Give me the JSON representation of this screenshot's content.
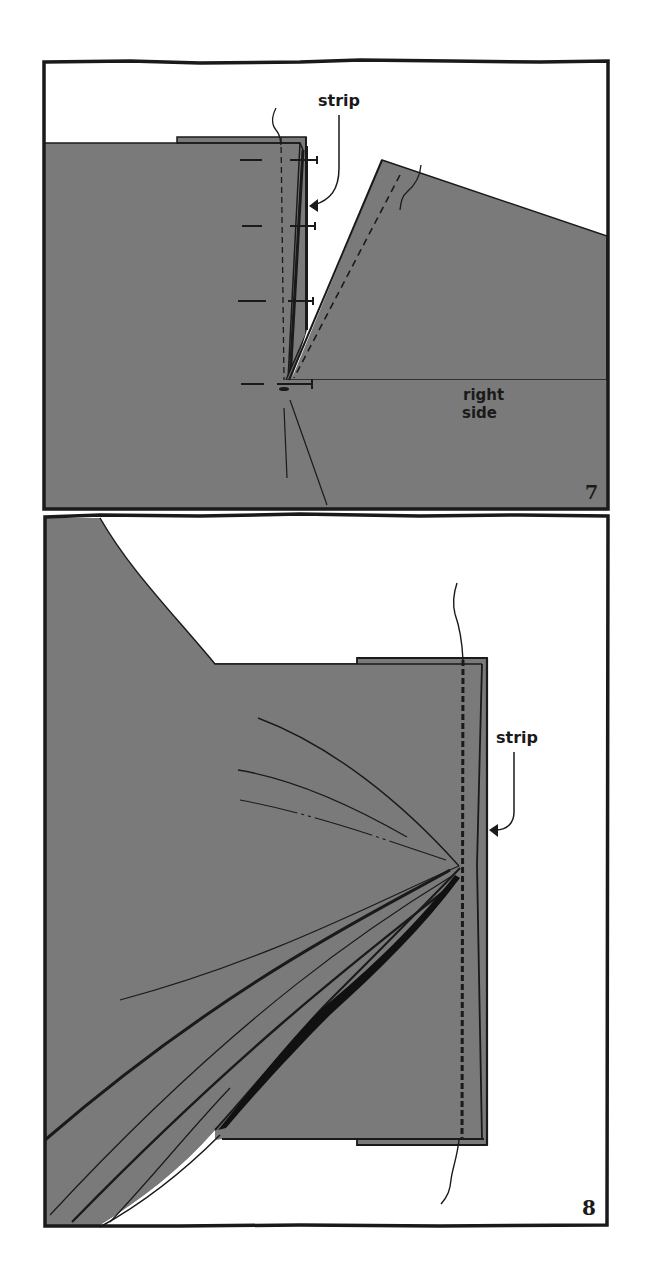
{
  "figure": {
    "panels": [
      {
        "number": "7",
        "labels": {
          "strip": "strip",
          "right_side_line1": "right",
          "right_side_line2": "side"
        }
      },
      {
        "number": "8",
        "labels": {
          "strip": "strip"
        }
      }
    ]
  },
  "colors": {
    "fabric": "#7a7a7a",
    "ink": "#1a1a1a",
    "paper": "#ffffff"
  }
}
